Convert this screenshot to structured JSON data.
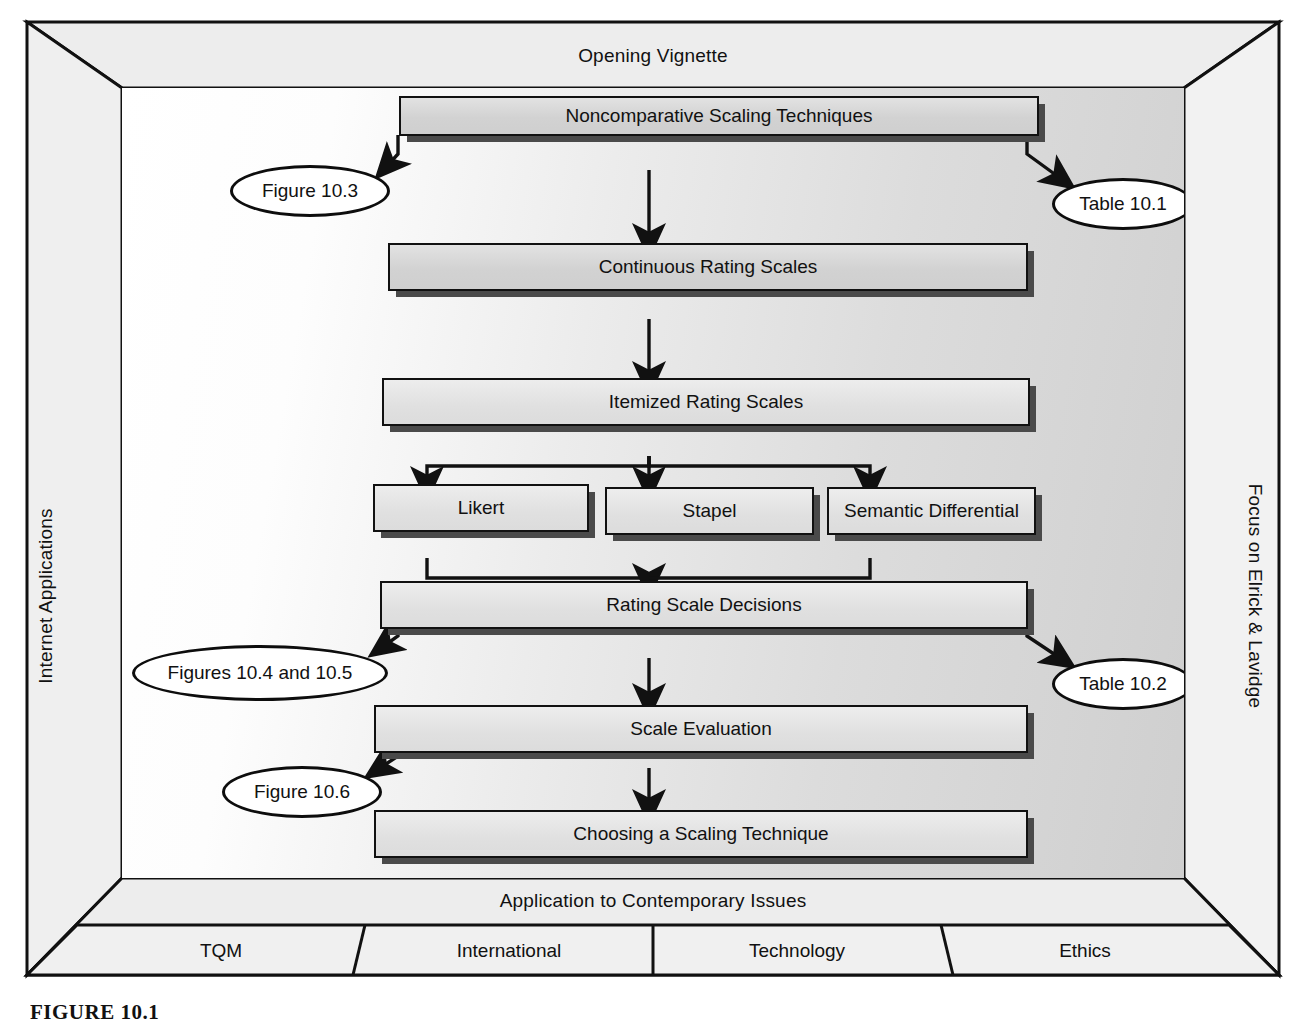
{
  "frame": {
    "top_label": "Opening Vignette",
    "left_label": "Internet Applications",
    "right_label": "Focus on Elrick & Lavidge",
    "bottom_label": "Application to Contemporary Issues"
  },
  "tabs": [
    {
      "label": "TQM"
    },
    {
      "label": "International"
    },
    {
      "label": "Technology"
    },
    {
      "label": "Ethics"
    }
  ],
  "flow": {
    "nodes": [
      {
        "id": "noncomparative",
        "label": "Noncomparative Scaling Techniques"
      },
      {
        "id": "continuous",
        "label": "Continuous Rating Scales"
      },
      {
        "id": "itemized",
        "label": "Itemized Rating Scales"
      },
      {
        "id": "likert",
        "label": "Likert"
      },
      {
        "id": "stapel",
        "label": "Stapel"
      },
      {
        "id": "semantic",
        "label": "Semantic Differential"
      },
      {
        "id": "decisions",
        "label": "Rating Scale Decisions"
      },
      {
        "id": "evaluation",
        "label": "Scale Evaluation"
      },
      {
        "id": "choosing",
        "label": "Choosing a Scaling Technique"
      }
    ],
    "callouts": [
      {
        "id": "fig103",
        "label": "Figure 10.3"
      },
      {
        "id": "table101",
        "label": "Table 10.1"
      },
      {
        "id": "fig104_105",
        "label": "Figures 10.4 and 10.5"
      },
      {
        "id": "table102",
        "label": "Table 10.2"
      },
      {
        "id": "fig106",
        "label": "Figure 10.6"
      }
    ]
  },
  "caption": {
    "text": "FIGURE 10.1"
  },
  "colors": {
    "ink": "#111111",
    "node_fill": "#d6d6d6",
    "node_shadow": "#4a4a4a",
    "frame_fill": "#ededed",
    "callout_fill": "#ffffff"
  }
}
